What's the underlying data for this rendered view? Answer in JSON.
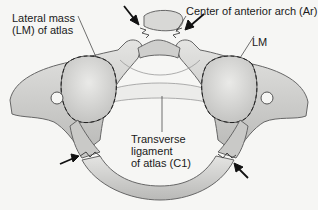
{
  "figure": {
    "labels": {
      "lateral_mass_line1": "Lateral mass",
      "lateral_mass_line2": "(LM) of atlas",
      "anterior_arch": "Center of anterior arch (Ar)",
      "lm_right": "LM",
      "transverse_line1": "Transverse",
      "transverse_line2": "ligament",
      "transverse_line3": "of atlas (C1)"
    },
    "fracture_arrows": 4,
    "colors": {
      "background": "#f6f6f4",
      "bone_fill": "#d6d6d4",
      "bone_light": "#e6e6e4",
      "outline": "#6a6a6a",
      "text": "#1a1a1a"
    }
  }
}
